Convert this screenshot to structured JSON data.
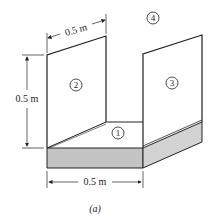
{
  "figure": {
    "caption": "(a)",
    "surfaces": [
      {
        "id": "1",
        "label": "1",
        "description": "floor"
      },
      {
        "id": "2",
        "label": "2",
        "description": "left wall"
      },
      {
        "id": "3",
        "label": "3",
        "description": "right wall"
      },
      {
        "id": "4",
        "label": "4",
        "description": "surroundings/opening"
      }
    ],
    "dimensions": {
      "top_width": "0.5 m",
      "height": "0.5 m",
      "bottom_width": "0.5 m"
    },
    "colors": {
      "line": "#222222",
      "slab_front": "#c4c4c4",
      "slab_side": "#d2d2d2"
    }
  }
}
